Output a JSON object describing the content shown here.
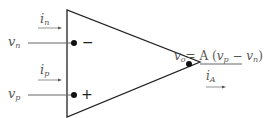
{
  "diagram": {
    "type": "op-amp",
    "inputs": {
      "inverting": {
        "voltage_label": {
          "base": "v",
          "sub": "n"
        },
        "current_label": {
          "base": "i",
          "sub": "n"
        },
        "terminal_sign": "−"
      },
      "non_inverting": {
        "voltage_label": {
          "base": "v",
          "sub": "p"
        },
        "current_label": {
          "base": "i",
          "sub": "p"
        },
        "terminal_sign": "+"
      }
    },
    "output": {
      "equation": {
        "lhs_base": "v",
        "lhs_sub": "o",
        "eq": "= A ",
        "paren_open": "(",
        "t1_base": "v",
        "t1_sub": "p",
        "minus": " − ",
        "t2_base": "v",
        "t2_sub": "n",
        "paren_close": ")"
      },
      "current_label": {
        "base": "i",
        "sub": "A"
      }
    },
    "colors": {
      "outline": "#222222",
      "wire": "#666666",
      "text": "#555555"
    }
  }
}
